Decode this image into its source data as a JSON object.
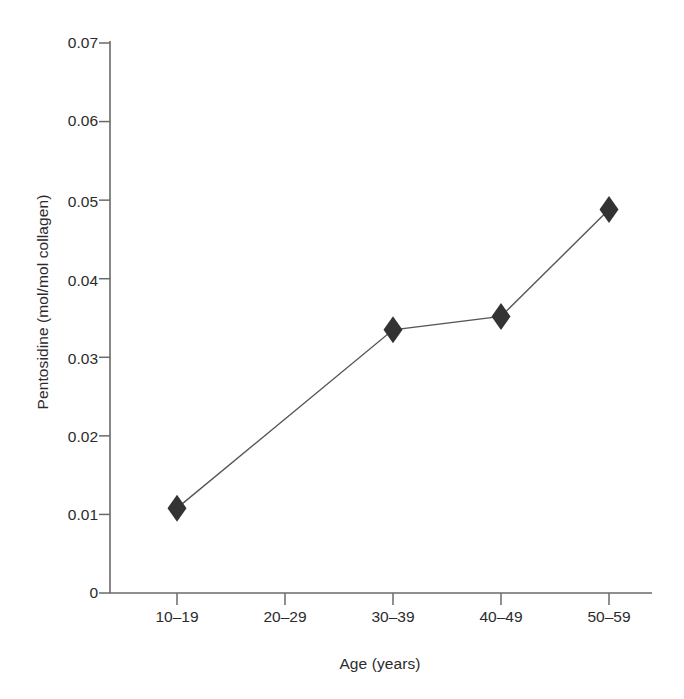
{
  "chart_data": {
    "type": "line",
    "title": "",
    "subtitle": "",
    "xlabel": "Age (years)",
    "ylabel": "Pentosidine (mol/mol collagen)",
    "categories": [
      "10–19",
      "20–29",
      "30–39",
      "40–49",
      "50–59"
    ],
    "values": [
      0.0108,
      null,
      0.0335,
      0.0352,
      0.0488
    ],
    "series": [
      {
        "name": "Pentosidine",
        "marker": "filled-diamond",
        "marker_color": "#333333",
        "line_color": "#555555",
        "values": [
          0.0108,
          null,
          0.0335,
          0.0352,
          0.0488
        ]
      }
    ],
    "points": [
      {
        "category": "10–19",
        "value": 0.0108
      },
      {
        "category": "30–39",
        "value": 0.0335
      },
      {
        "category": "40–49",
        "value": 0.0352
      },
      {
        "category": "50–59",
        "value": 0.0488
      }
    ],
    "ylim": [
      0,
      0.07
    ],
    "ytick_values": [
      0,
      0.01,
      0.02,
      0.03,
      0.04,
      0.05,
      0.06,
      0.07
    ],
    "ytick_labels": [
      "0",
      "0.01",
      "0.02",
      "0.03",
      "0.04",
      "0.05",
      "0.06",
      "0.07"
    ],
    "grid": false,
    "legend": false,
    "legend_position": "none",
    "background_color": "#ffffff",
    "axis_color": "#666666"
  },
  "axes": {
    "y_title": "Pentosidine (mol/mol collagen)",
    "x_title": "Age (years)",
    "y_ticks": [
      {
        "label": "0.07",
        "value": 0.07
      },
      {
        "label": "0.06",
        "value": 0.06
      },
      {
        "label": "0.05",
        "value": 0.05
      },
      {
        "label": "0.04",
        "value": 0.04
      },
      {
        "label": "0.03",
        "value": 0.03
      },
      {
        "label": "0.02",
        "value": 0.02
      },
      {
        "label": "0.01",
        "value": 0.01
      },
      {
        "label": "0",
        "value": 0
      }
    ],
    "x_ticks": [
      {
        "label": "10–19"
      },
      {
        "label": "20–29"
      },
      {
        "label": "30–39"
      },
      {
        "label": "40–49"
      },
      {
        "label": "50–59"
      }
    ]
  }
}
